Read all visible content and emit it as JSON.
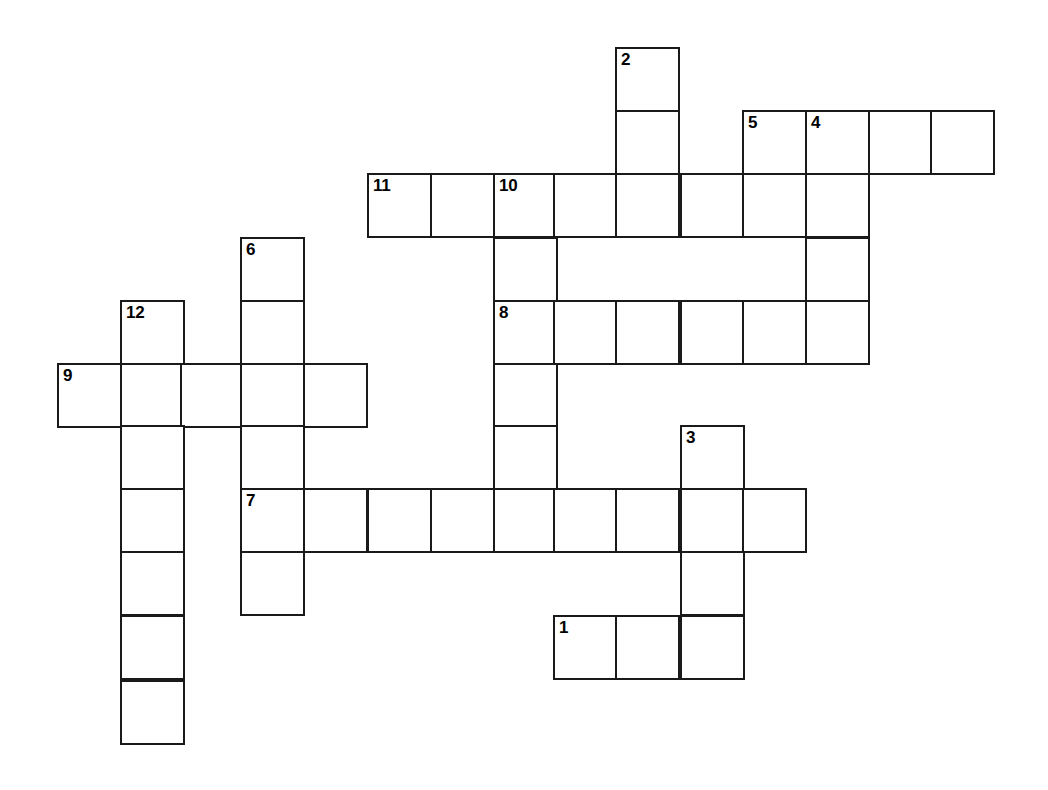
{
  "puzzle": {
    "kind": "crossword-grid",
    "title": "Blank Crossword Puzzle Grid",
    "background_color": "#ffffff",
    "cell_border_color": "#1a1a1a",
    "cell_fill_color": "#ffffff",
    "number_color": "#000000",
    "cell_size": 63,
    "grid_origin": {
      "x": 57,
      "y": 47
    },
    "columns_x": [
      57,
      120,
      180,
      240,
      303,
      367,
      430,
      493,
      553,
      615,
      680,
      742,
      805,
      868,
      930
    ],
    "rows_y": [
      47,
      110,
      173,
      237,
      300,
      363,
      425,
      488,
      551,
      615,
      680
    ],
    "clue_numbers": [
      "1",
      "2",
      "3",
      "4",
      "5",
      "6",
      "7",
      "8",
      "9",
      "10",
      "11",
      "12"
    ],
    "entries": [
      {
        "number": "2",
        "direction": "down",
        "col": 9,
        "row": 0,
        "length": 3
      },
      {
        "number": "5",
        "direction": "down",
        "col": 11,
        "row": 1,
        "length": 2
      },
      {
        "number": "4",
        "direction": "across",
        "col": 12,
        "row": 1,
        "length": 3
      },
      {
        "number": "4",
        "direction": "down",
        "col": 12,
        "row": 1,
        "length": 4
      },
      {
        "number": "11",
        "direction": "across",
        "col": 5,
        "row": 2,
        "length": 7
      },
      {
        "number": "10",
        "direction": "down",
        "col": 7,
        "row": 2,
        "length": 6
      },
      {
        "number": "6",
        "direction": "down",
        "col": 3,
        "row": 3,
        "length": 6
      },
      {
        "number": "12",
        "direction": "down",
        "col": 1,
        "row": 4,
        "length": 7
      },
      {
        "number": "8",
        "direction": "across",
        "col": 7,
        "row": 4,
        "length": 6
      },
      {
        "number": "9",
        "direction": "across",
        "col": 0,
        "row": 5,
        "length": 5
      },
      {
        "number": "3",
        "direction": "down",
        "col": 10,
        "row": 6,
        "length": 4
      },
      {
        "number": "7",
        "direction": "across",
        "col": 3,
        "row": 7,
        "length": 9
      },
      {
        "number": "1",
        "direction": "across",
        "col": 8,
        "row": 9,
        "length": 3
      }
    ],
    "cells": [
      {
        "col": 9,
        "row": 0,
        "number": "2"
      },
      {
        "col": 9,
        "row": 1,
        "number": ""
      },
      {
        "col": 11,
        "row": 1,
        "number": "5"
      },
      {
        "col": 12,
        "row": 1,
        "number": "4"
      },
      {
        "col": 13,
        "row": 1,
        "number": ""
      },
      {
        "col": 14,
        "row": 1,
        "number": ""
      },
      {
        "col": 5,
        "row": 2,
        "number": "11"
      },
      {
        "col": 6,
        "row": 2,
        "number": ""
      },
      {
        "col": 7,
        "row": 2,
        "number": "10"
      },
      {
        "col": 8,
        "row": 2,
        "number": ""
      },
      {
        "col": 9,
        "row": 2,
        "number": ""
      },
      {
        "col": 10,
        "row": 2,
        "number": ""
      },
      {
        "col": 11,
        "row": 2,
        "number": ""
      },
      {
        "col": 12,
        "row": 2,
        "number": ""
      },
      {
        "col": 3,
        "row": 3,
        "number": "6"
      },
      {
        "col": 7,
        "row": 3,
        "number": ""
      },
      {
        "col": 12,
        "row": 3,
        "number": ""
      },
      {
        "col": 1,
        "row": 4,
        "number": "12"
      },
      {
        "col": 3,
        "row": 4,
        "number": ""
      },
      {
        "col": 7,
        "row": 4,
        "number": "8"
      },
      {
        "col": 8,
        "row": 4,
        "number": ""
      },
      {
        "col": 9,
        "row": 4,
        "number": ""
      },
      {
        "col": 10,
        "row": 4,
        "number": ""
      },
      {
        "col": 11,
        "row": 4,
        "number": ""
      },
      {
        "col": 12,
        "row": 4,
        "number": ""
      },
      {
        "col": 0,
        "row": 5,
        "number": "9"
      },
      {
        "col": 1,
        "row": 5,
        "number": ""
      },
      {
        "col": 2,
        "row": 5,
        "number": ""
      },
      {
        "col": 3,
        "row": 5,
        "number": ""
      },
      {
        "col": 4,
        "row": 5,
        "number": ""
      },
      {
        "col": 7,
        "row": 5,
        "number": ""
      },
      {
        "col": 1,
        "row": 6,
        "number": ""
      },
      {
        "col": 3,
        "row": 6,
        "number": ""
      },
      {
        "col": 7,
        "row": 6,
        "number": ""
      },
      {
        "col": 10,
        "row": 6,
        "number": "3"
      },
      {
        "col": 1,
        "row": 7,
        "number": ""
      },
      {
        "col": 3,
        "row": 7,
        "number": "7"
      },
      {
        "col": 4,
        "row": 7,
        "number": ""
      },
      {
        "col": 5,
        "row": 7,
        "number": ""
      },
      {
        "col": 6,
        "row": 7,
        "number": ""
      },
      {
        "col": 7,
        "row": 7,
        "number": ""
      },
      {
        "col": 8,
        "row": 7,
        "number": ""
      },
      {
        "col": 9,
        "row": 7,
        "number": ""
      },
      {
        "col": 10,
        "row": 7,
        "number": ""
      },
      {
        "col": 11,
        "row": 7,
        "number": ""
      },
      {
        "col": 1,
        "row": 8,
        "number": ""
      },
      {
        "col": 3,
        "row": 8,
        "number": ""
      },
      {
        "col": 10,
        "row": 8,
        "number": ""
      },
      {
        "col": 1,
        "row": 9,
        "number": ""
      },
      {
        "col": 8,
        "row": 9,
        "number": "1"
      },
      {
        "col": 9,
        "row": 9,
        "number": ""
      },
      {
        "col": 10,
        "row": 9,
        "number": ""
      },
      {
        "col": 1,
        "row": 10,
        "number": ""
      }
    ]
  }
}
